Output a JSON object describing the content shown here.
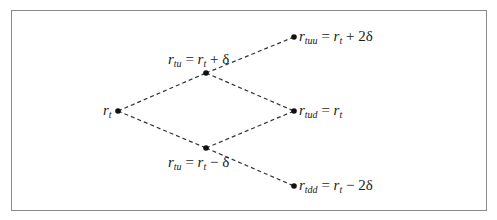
{
  "diagram": {
    "type": "binomial-interest-rate-tree",
    "nodes": [
      {
        "id": "root",
        "var": "r",
        "sub": "t",
        "rhs": "",
        "x": 118,
        "y": 111
      },
      {
        "id": "up",
        "var": "r",
        "sub": "tu",
        "rhs": "r",
        "rhs_sub": "t",
        "op": "+",
        "term": "δ",
        "x": 206,
        "y": 73
      },
      {
        "id": "down",
        "var": "r",
        "sub": "tu",
        "rhs": "r",
        "rhs_sub": "t",
        "op": "−",
        "term": "δ",
        "x": 206,
        "y": 148
      },
      {
        "id": "uu",
        "var": "r",
        "sub": "tuu",
        "rhs": "r",
        "rhs_sub": "t",
        "op": "+",
        "term": "2δ",
        "x": 294,
        "y": 37
      },
      {
        "id": "ud",
        "var": "r",
        "sub": "tud",
        "rhs": "r",
        "rhs_sub": "t",
        "op": "",
        "term": "",
        "x": 294,
        "y": 111
      },
      {
        "id": "dd",
        "var": "r",
        "sub": "tdd",
        "rhs": "r",
        "rhs_sub": "t",
        "op": "−",
        "term": "2δ",
        "x": 294,
        "y": 186
      }
    ],
    "edges": [
      [
        "root",
        "up"
      ],
      [
        "root",
        "down"
      ],
      [
        "up",
        "uu"
      ],
      [
        "up",
        "ud"
      ],
      [
        "down",
        "ud"
      ],
      [
        "down",
        "dd"
      ]
    ],
    "labels": {
      "root": {
        "var": "r",
        "sub": "t"
      },
      "up": {
        "var": "r",
        "sub": "tu",
        "eq": "=",
        "rhs": "r",
        "rhs_sub": "t",
        "tail": "+ δ"
      },
      "down": {
        "var": "r",
        "sub": "tu",
        "eq": "=",
        "rhs": "r",
        "rhs_sub": "t",
        "tail": "− δ"
      },
      "uu": {
        "var": "r",
        "sub": "tuu",
        "eq": "=",
        "rhs": "r",
        "rhs_sub": "t",
        "tail": "+ 2δ"
      },
      "ud": {
        "var": "r",
        "sub": "tud",
        "eq": "=",
        "rhs": "r",
        "rhs_sub": "t",
        "tail": ""
      },
      "dd": {
        "var": "r",
        "sub": "tdd",
        "eq": "=",
        "rhs": "r",
        "rhs_sub": "t",
        "tail": "− 2δ"
      }
    },
    "colors": {
      "line": "#333333",
      "node": "#111111",
      "frame": "#8a8a8a",
      "text": "#1a1a1a"
    }
  }
}
